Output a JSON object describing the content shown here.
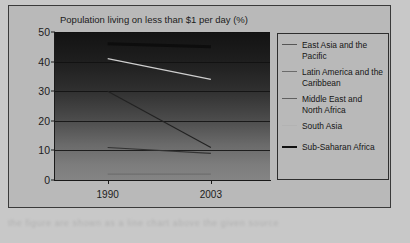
{
  "figure": {
    "title": "Population living on less than $1 per day (%)",
    "artifact_text": "the figure are shown as a line chart above the given source"
  },
  "legend": {
    "items": [
      {
        "label": "East Asia and the Pacific",
        "color": "#555555",
        "width": 1.2
      },
      {
        "label": "Latin America and the Caribbean",
        "color": "#6b6b6b",
        "width": 1.2
      },
      {
        "label": "Middle East and North Africa",
        "color": "#606060",
        "width": 1.2
      },
      {
        "label": "South Asia",
        "color": "#b3b3b3",
        "width": 1.2
      },
      {
        "label": "Sub-Saharan Africa",
        "color": "#111111",
        "width": 2.6
      }
    ]
  },
  "chart_data": {
    "type": "line",
    "title": "Population living on less than $1 per day (%)",
    "xlabel": "",
    "ylabel": "",
    "x": [
      "1990",
      "2003"
    ],
    "xticks": [
      "1990",
      "2003"
    ],
    "yticks": [
      0,
      10,
      20,
      30,
      40,
      50
    ],
    "ylim": [
      0,
      50
    ],
    "grid": true,
    "legend_position": "right",
    "series": [
      {
        "name": "East Asia and the Pacific",
        "values": [
          30,
          11
        ],
        "color": "#222222"
      },
      {
        "name": "Latin America and the Caribbean",
        "values": [
          11,
          9
        ],
        "color": "#333333"
      },
      {
        "name": "Middle East and North Africa",
        "values": [
          2,
          2
        ],
        "color": "#6e6e6e"
      },
      {
        "name": "South Asia",
        "values": [
          41,
          34
        ],
        "color": "#cfcfcf"
      },
      {
        "name": "Sub-Saharan Africa",
        "values": [
          46,
          45
        ],
        "color": "#0d0d0d"
      }
    ]
  }
}
